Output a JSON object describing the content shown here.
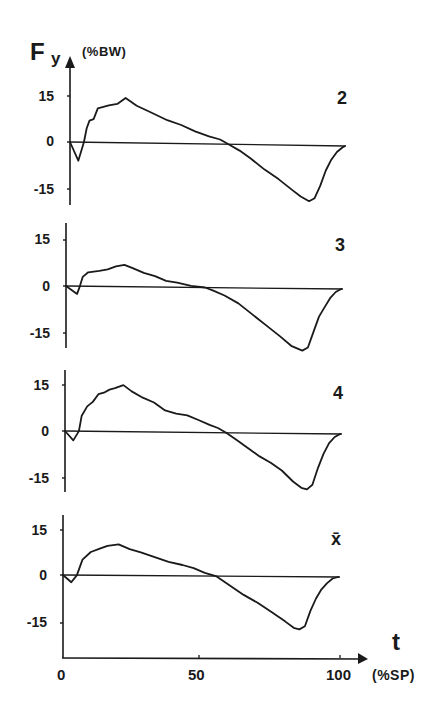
{
  "figure": {
    "y_symbol": "F",
    "y_subscript": "y",
    "y_unit": "(%BW)",
    "x_symbol": "t",
    "x_unit": "(%SP)",
    "x_ticks": [
      "0",
      "50",
      "100"
    ],
    "y_ticks": [
      "15",
      "0",
      "-15"
    ]
  },
  "chart_data": [
    {
      "type": "line",
      "title": "2",
      "xlabel": "t (%SP)",
      "ylabel": "Fy (%BW)",
      "xlim": [
        0,
        100
      ],
      "ylim": [
        -20,
        17
      ],
      "yticks": [
        15,
        0,
        -15
      ],
      "grid": false,
      "x": [
        0,
        3,
        5,
        6,
        7,
        8.5,
        10,
        14,
        17,
        20,
        24,
        29,
        35,
        40,
        45,
        50,
        54,
        57,
        61,
        65,
        70,
        75,
        80,
        83,
        86,
        88,
        90,
        92,
        94,
        96,
        98,
        99
      ],
      "y": [
        0,
        -6,
        0,
        4.5,
        7,
        7.5,
        11,
        12,
        12.5,
        14.5,
        12,
        10,
        7.5,
        6,
        4,
        2.5,
        1.5,
        0,
        -2,
        -4.5,
        -8,
        -11,
        -14.5,
        -16.5,
        -18,
        -17,
        -13,
        -8,
        -4.5,
        -2,
        -0.5,
        0
      ]
    },
    {
      "type": "line",
      "title": "3",
      "xlabel": "t (%SP)",
      "ylabel": "Fy (%BW)",
      "xlim": [
        0,
        100
      ],
      "ylim": [
        -20,
        17
      ],
      "yticks": [
        15,
        0,
        -15
      ],
      "grid": false,
      "x": [
        0,
        4,
        5,
        6,
        8,
        12,
        15,
        18,
        21,
        24,
        28,
        32,
        36,
        40,
        45,
        50,
        53,
        57,
        62,
        67,
        72,
        77,
        81,
        85,
        87,
        89,
        91,
        93,
        95,
        97,
        99
      ],
      "y": [
        0,
        -2.5,
        0,
        3,
        4.5,
        5,
        5.5,
        6.5,
        7,
        6,
        4.5,
        3.5,
        2,
        1.5,
        0.5,
        0,
        -1,
        -2.5,
        -5,
        -8.5,
        -12,
        -15.5,
        -18.5,
        -20,
        -19,
        -14,
        -9,
        -6,
        -3,
        -1,
        0
      ]
    },
    {
      "type": "line",
      "title": "4",
      "xlabel": "t (%SP)",
      "ylabel": "Fy (%BW)",
      "xlim": [
        0,
        100
      ],
      "ylim": [
        -20,
        17
      ],
      "yticks": [
        15,
        0,
        -15
      ],
      "grid": false,
      "x": [
        0,
        3,
        5,
        6,
        8,
        10,
        12,
        14,
        16,
        18,
        21,
        24,
        28,
        32,
        36,
        40,
        44,
        48,
        52,
        55,
        58,
        62,
        66,
        70,
        74,
        78,
        82,
        85,
        87,
        89,
        91,
        93,
        95,
        97,
        99
      ],
      "y": [
        0,
        -3,
        0,
        5,
        8,
        9.5,
        12,
        12.5,
        13.5,
        14,
        15,
        13,
        11,
        9.5,
        7,
        6,
        5.5,
        4,
        2.5,
        1.5,
        0,
        -2.5,
        -5,
        -7.5,
        -9.5,
        -12,
        -15.5,
        -17.5,
        -18,
        -16.5,
        -11,
        -6.5,
        -3,
        -1,
        0
      ]
    },
    {
      "type": "line",
      "title": "x̄",
      "xlabel": "t (%SP)",
      "ylabel": "Fy (%BW)",
      "xlim": [
        0,
        100
      ],
      "ylim": [
        -20,
        17
      ],
      "yticks": [
        15,
        0,
        -15
      ],
      "grid": false,
      "x": [
        0,
        3,
        5,
        7,
        10,
        13,
        16,
        20,
        24,
        28,
        33,
        38,
        43,
        47,
        51,
        55,
        60,
        65,
        70,
        75,
        80,
        83,
        85,
        87,
        89,
        91,
        93,
        95,
        97,
        99
      ],
      "y": [
        0,
        -2.3,
        0,
        5,
        7.5,
        8.5,
        9.5,
        10,
        8.5,
        7.5,
        6,
        4.5,
        3.5,
        2.5,
        1,
        0,
        -3,
        -6,
        -8.5,
        -11.5,
        -14.5,
        -16.5,
        -17,
        -16,
        -11,
        -7,
        -4,
        -2,
        -0.5,
        0
      ]
    }
  ],
  "panels_layout": [
    {
      "axis_x": 70,
      "zero_y": 142,
      "px_per_unit": 3.1,
      "axis_top": 58,
      "axis_bottom": 205,
      "zero_end_x": 345,
      "zero_end_dy": 4,
      "tick15_y": 96,
      "tickm15_y": 189,
      "label_x": 337,
      "label_y": 89
    },
    {
      "axis_x": 66,
      "zero_y": 286,
      "px_per_unit": 3.1,
      "axis_top": 223,
      "axis_bottom": 348,
      "zero_end_x": 343,
      "zero_end_dy": 3,
      "tick15_y": 240,
      "tickm15_y": 333,
      "label_x": 335,
      "label_y": 236
    },
    {
      "axis_x": 65,
      "zero_y": 431,
      "px_per_unit": 3.1,
      "axis_top": 370,
      "axis_bottom": 492,
      "zero_end_x": 342,
      "zero_end_dy": 3,
      "tick15_y": 385,
      "tickm15_y": 478,
      "label_x": 333,
      "label_y": 384
    },
    {
      "axis_x": 63,
      "zero_y": 575,
      "px_per_unit": 3.1,
      "axis_top": 515,
      "axis_bottom": 658,
      "zero_end_x": 340,
      "zero_end_dy": 2,
      "tick15_y": 530,
      "tickm15_y": 623,
      "label_x": 331,
      "label_y": 532
    }
  ],
  "x_axis": {
    "y": 658,
    "x0": 62,
    "x50": 199,
    "x100": 340,
    "arrow_tip": 368
  }
}
